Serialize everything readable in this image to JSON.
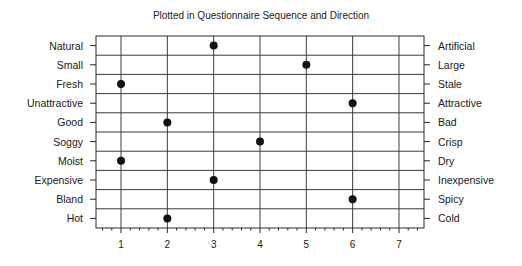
{
  "chart_data": {
    "type": "scatter",
    "subtype": "dot-plot / semantic differential",
    "title": "Plotted in Questionnaire Sequence and Direction",
    "xlabel": "",
    "ylabel": "",
    "xlim": [
      0.46,
      7.54
    ],
    "x_ticks": [
      1,
      2,
      3,
      4,
      5,
      6,
      7
    ],
    "minor_ticks_per_unit": 5,
    "grid": true,
    "legend": null,
    "left_labels": [
      "Natural",
      "Small",
      "Fresh",
      "Unattractive",
      "Good",
      "Soggy",
      "Moist",
      "Expensive",
      "Bland",
      "Hot"
    ],
    "right_labels": [
      "Artificial",
      "Large",
      "Stale",
      "Attractive",
      "Bad",
      "Crisp",
      "Dry",
      "Inexpensive",
      "Spicy",
      "Cold"
    ],
    "values": [
      3,
      5,
      1,
      6,
      2,
      4,
      1,
      3,
      6,
      2
    ],
    "points": [
      {
        "left": "Natural",
        "right": "Artificial",
        "value": 3
      },
      {
        "left": "Small",
        "right": "Large",
        "value": 5
      },
      {
        "left": "Fresh",
        "right": "Stale",
        "value": 1
      },
      {
        "left": "Unattractive",
        "right": "Attractive",
        "value": 6
      },
      {
        "left": "Good",
        "right": "Bad",
        "value": 2
      },
      {
        "left": "Soggy",
        "right": "Crisp",
        "value": 4
      },
      {
        "left": "Moist",
        "right": "Dry",
        "value": 1
      },
      {
        "left": "Expensive",
        "right": "Inexpensive",
        "value": 3
      },
      {
        "left": "Bland",
        "right": "Spicy",
        "value": 6
      },
      {
        "left": "Hot",
        "right": "Cold",
        "value": 2
      }
    ]
  },
  "colors": {
    "frame": "#2a2a2a",
    "grid": "#3a3a3a",
    "point": "#111111",
    "text": "#1a1a1a"
  }
}
